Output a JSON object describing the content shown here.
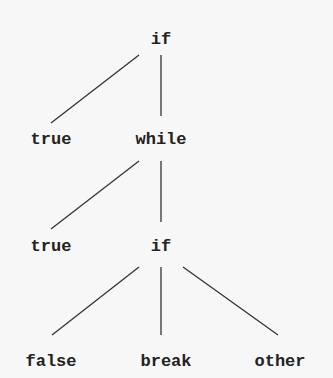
{
  "tree": {
    "nodes": [
      {
        "id": "n0",
        "label": "if",
        "x": 161,
        "y": 30
      },
      {
        "id": "n1",
        "label": "true",
        "x": 51,
        "y": 130
      },
      {
        "id": "n2",
        "label": "while",
        "x": 161,
        "y": 130
      },
      {
        "id": "n3",
        "label": "true",
        "x": 51,
        "y": 237
      },
      {
        "id": "n4",
        "label": "if",
        "x": 161,
        "y": 237
      },
      {
        "id": "n5",
        "label": "false",
        "x": 51,
        "y": 352
      },
      {
        "id": "n6",
        "label": "break",
        "x": 166,
        "y": 352
      },
      {
        "id": "n7",
        "label": "other",
        "x": 280,
        "y": 352
      }
    ],
    "edges": [
      {
        "from": "n0",
        "to": "n1",
        "x1": 139,
        "y1": 55,
        "x2": 51,
        "y2": 123
      },
      {
        "from": "n0",
        "to": "n2",
        "x1": 161,
        "y1": 55,
        "x2": 161,
        "y2": 116
      },
      {
        "from": "n2",
        "to": "n3",
        "x1": 139,
        "y1": 161,
        "x2": 51,
        "y2": 229
      },
      {
        "from": "n2",
        "to": "n4",
        "x1": 161,
        "y1": 161,
        "x2": 161,
        "y2": 222
      },
      {
        "from": "n4",
        "to": "n5",
        "x1": 139,
        "y1": 267,
        "x2": 52,
        "y2": 335
      },
      {
        "from": "n4",
        "to": "n6",
        "x1": 161,
        "y1": 267,
        "x2": 161,
        "y2": 335
      },
      {
        "from": "n4",
        "to": "n7",
        "x1": 183,
        "y1": 267,
        "x2": 278,
        "y2": 335
      }
    ]
  }
}
